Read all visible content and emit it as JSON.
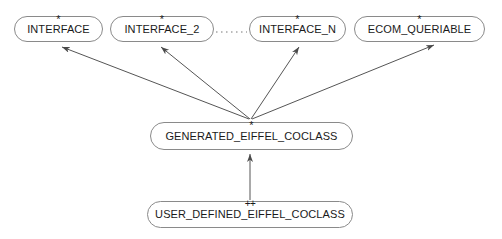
{
  "diagram": {
    "type": "class-inheritance-diagram",
    "canvas": {
      "width": 502,
      "height": 239
    },
    "colors": {
      "background": "#ffffff",
      "node_border": "#8a8a8a",
      "node_fill": "#ffffff",
      "edge": "#555555",
      "text": "#1a1a1a"
    },
    "nodes": [
      {
        "id": "interface",
        "label": "INTERFACE",
        "marker": "*",
        "marker_kind": "deferred-star",
        "x": 14,
        "y": 16,
        "width": 89,
        "height": 26
      },
      {
        "id": "interface_2",
        "label": "INTERFACE_2",
        "marker": "*",
        "marker_kind": "deferred-star",
        "x": 110,
        "y": 16,
        "width": 104,
        "height": 26
      },
      {
        "id": "interface_n",
        "label": "INTERFACE_N",
        "marker": "*",
        "marker_kind": "deferred-star",
        "x": 249,
        "y": 16,
        "width": 97,
        "height": 26
      },
      {
        "id": "ecom_queriable",
        "label": "ECOM_QUERIABLE",
        "marker": "*",
        "marker_kind": "deferred-star",
        "x": 354,
        "y": 16,
        "width": 131,
        "height": 26
      },
      {
        "id": "generated_eiffel_coclass",
        "label": "GENERATED_EIFFEL_COCLASS",
        "marker": "*",
        "marker_kind": "deferred-star",
        "x": 150,
        "y": 122,
        "width": 203,
        "height": 28
      },
      {
        "id": "user_defined_eiffel_coclass",
        "label": "USER_DEFINED_EIFFEL_COCLASS",
        "marker": "++",
        "marker_kind": "effective-plusplus",
        "x": 147,
        "y": 201,
        "width": 206,
        "height": 27
      }
    ],
    "edges": [
      {
        "id": "edge-generated-to-interface",
        "from": "generated_eiffel_coclass",
        "to": "interface",
        "style": "solid",
        "arrow": "to",
        "relation": "inherits"
      },
      {
        "id": "edge-generated-to-interface-2",
        "from": "generated_eiffel_coclass",
        "to": "interface_2",
        "style": "solid",
        "arrow": "to",
        "relation": "inherits"
      },
      {
        "id": "edge-generated-to-interface-n",
        "from": "generated_eiffel_coclass",
        "to": "interface_n",
        "style": "solid",
        "arrow": "to",
        "relation": "inherits"
      },
      {
        "id": "edge-generated-to-ecom-queriable",
        "from": "generated_eiffel_coclass",
        "to": "ecom_queriable",
        "style": "solid",
        "arrow": "to",
        "relation": "inherits"
      },
      {
        "id": "edge-user-defined-to-generated",
        "from": "user_defined_eiffel_coclass",
        "to": "generated_eiffel_coclass",
        "style": "solid",
        "arrow": "to",
        "relation": "inherits"
      },
      {
        "id": "edge-ellipsis-interfaces",
        "from": "interface_2",
        "to": "interface_n",
        "style": "dotted",
        "arrow": "none",
        "relation": "continuation"
      }
    ]
  }
}
